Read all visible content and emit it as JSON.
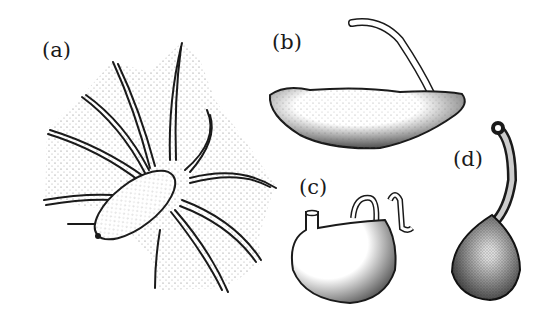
{
  "figure": {
    "panels": [
      {
        "id": "a",
        "label": "(a)",
        "subject": "organism with webbed radiating tentacles"
      },
      {
        "id": "b",
        "label": "(b)",
        "subject": "elongated body with long tail-like appendage"
      },
      {
        "id": "c",
        "label": "(c)",
        "subject": "rounded sac-like body with short curled appendages"
      },
      {
        "id": "d",
        "label": "(d)",
        "subject": "pear-shaped body with long curved neck"
      }
    ],
    "colors": {
      "ink": "#1a1a1a",
      "background": "#ffffff",
      "stipple": "#555555"
    }
  }
}
